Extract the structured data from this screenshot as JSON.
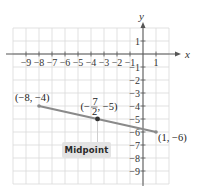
{
  "diagram": {
    "type": "coordinate-plane-midpoint",
    "axes": {
      "x_label": "x",
      "y_label": "y",
      "x_range": [
        -10,
        2
      ],
      "y_range": [
        -10,
        2
      ],
      "x_tick_labels": [
        -9,
        -8,
        -7,
        -6,
        -5,
        -4,
        -3,
        -2,
        -1,
        1
      ],
      "y_tick_labels": [
        1,
        -1,
        -2,
        -3,
        -4,
        -5,
        -6,
        -7,
        -8,
        -9
      ]
    },
    "grid": true,
    "points": [
      {
        "name": "endpoint-a",
        "x": -8,
        "y": -4,
        "label": "(−8, −4)"
      },
      {
        "name": "endpoint-b",
        "x": 1,
        "y": -6,
        "label": "(1, −6)"
      },
      {
        "name": "midpoint",
        "x": -3.5,
        "y": -5,
        "label_num": "7",
        "label_den": "2",
        "label_prefix": "(−",
        "label_suffix": ", −5)"
      }
    ],
    "segment": {
      "from": [
        -8,
        -4
      ],
      "to": [
        1,
        -6
      ],
      "color": "#8a8a8a"
    },
    "callout": {
      "text": "Midpoint",
      "background": "#e3e3e3"
    },
    "colors": {
      "grid": "#d9d9d9",
      "axis": "#555555",
      "segment": "#8a8a8a",
      "point": "#333333"
    }
  }
}
